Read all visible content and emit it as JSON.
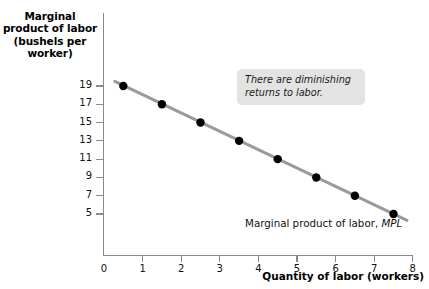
{
  "chart_data": {
    "type": "scatter",
    "title": "",
    "xlabel": "Quantity of labor (workers)",
    "ylabel": "Marginal product of labor (bushels per worker)",
    "ylabel_lines": [
      "Marginal",
      "product of labor",
      "(bushels per",
      "worker)"
    ],
    "x": [
      0.5,
      1.5,
      2.5,
      3.5,
      4.5,
      5.5,
      6.5,
      7.5
    ],
    "values": [
      19,
      17,
      15,
      13,
      11,
      9,
      7,
      5
    ],
    "series": [
      {
        "name": "Marginal product of labor, MPL",
        "x": [
          0.5,
          1.5,
          2.5,
          3.5,
          4.5,
          5.5,
          6.5,
          7.5
        ],
        "values": [
          19,
          17,
          15,
          13,
          11,
          9,
          7,
          5
        ]
      }
    ],
    "line": {
      "x_start": 0.28,
      "y_start": 19.5,
      "x_end": 7.85,
      "y_end": 4.3,
      "color": "#9a9a9a",
      "width": 3
    },
    "xlim": [
      0,
      8
    ],
    "ylim": [
      4,
      20
    ],
    "xticks": [
      "0",
      "1",
      "2",
      "3",
      "4",
      "5",
      "6",
      "7",
      "8"
    ],
    "xtick_values": [
      0,
      1,
      2,
      3,
      4,
      5,
      6,
      7,
      8
    ],
    "yticks": [
      "19",
      "17",
      "15",
      "13",
      "11",
      "9",
      "7",
      "5"
    ],
    "ytick_values": [
      19,
      17,
      15,
      13,
      11,
      9,
      7,
      5
    ],
    "y_origin_label": "0",
    "grid": false,
    "legend": "none",
    "marker_color": "#000000",
    "axis_color": "#8a8a8a"
  },
  "annotation": {
    "lines": [
      "There are diminishing",
      "returns to labor."
    ],
    "line1": "There are diminishing",
    "line2": "returns to labor.",
    "background": "#e3e3e3"
  },
  "curve_label": {
    "prefix": "Marginal product of labor, ",
    "symbol": "MPL"
  },
  "axis_titles": {
    "y_line1": "Marginal",
    "y_line2": "product of labor",
    "y_line3": "(bushels per",
    "y_line4": "worker)",
    "x": "Quantity of labor (workers)"
  }
}
